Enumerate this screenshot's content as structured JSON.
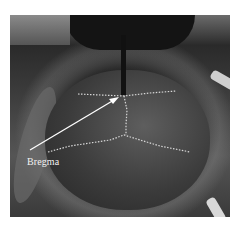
{
  "figure": {
    "annotation": {
      "label": "Bregma",
      "arrow_from": [
        30,
        150
      ],
      "arrow_to": [
        118,
        98
      ]
    },
    "landmark_point": [
      124,
      96
    ],
    "colors": {
      "suture_line": "#d8d8d8",
      "arrow": "#ffffff",
      "label_text": "#f2f2f2"
    }
  }
}
